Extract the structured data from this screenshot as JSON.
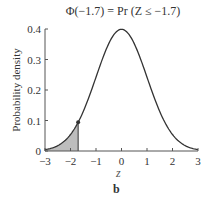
{
  "chart_data": {
    "type": "line",
    "title": "Φ(−1.7) = Pr (Z ≤ −1.7)",
    "xlabel": "z",
    "ylabel": "Probability density",
    "panel_label": "b",
    "xlim": [
      -3,
      3
    ],
    "ylim": [
      0,
      0.4
    ],
    "xticks": [
      "−3",
      "−2",
      "−1",
      "0",
      "1",
      "2",
      "3"
    ],
    "yticks": [
      "0",
      "0.1",
      "0.2",
      "0.3",
      "0.4"
    ],
    "grid": false,
    "series": [
      {
        "name": "Standard normal density",
        "x": [
          -3,
          -2.5,
          -2,
          -1.7,
          -1.5,
          -1,
          -0.5,
          0,
          0.5,
          1,
          1.5,
          2,
          2.5,
          3
        ],
        "y": [
          0.0044,
          0.0175,
          0.054,
          0.094,
          0.1295,
          0.242,
          0.352,
          0.399,
          0.352,
          0.242,
          0.1295,
          0.054,
          0.0175,
          0.0044
        ]
      }
    ],
    "shaded_region": {
      "from": -3,
      "to": -1.7,
      "label": "Pr(Z ≤ −1.7)",
      "color": "#bdbdbd"
    },
    "marked_point": {
      "x": -1.7,
      "y": 0.094
    },
    "colors": {
      "curve": "#333333",
      "shade": "#bdbdbd",
      "axis": "#555555"
    }
  }
}
